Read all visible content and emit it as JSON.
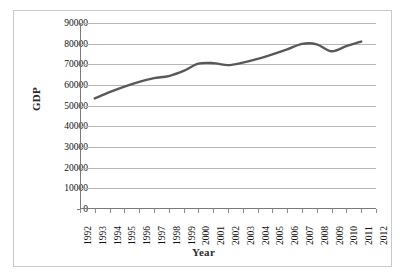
{
  "chart_data": {
    "type": "line",
    "title": "",
    "xlabel": "Year",
    "ylabel": "GDP",
    "x": [
      1993,
      1994,
      1995,
      1996,
      1997,
      1998,
      1999,
      2000,
      2001,
      2002,
      2003,
      2004,
      2005,
      2006,
      2007,
      2008,
      2009,
      2010,
      2011
    ],
    "values": [
      53500,
      56500,
      59200,
      61500,
      63300,
      64300,
      66800,
      70300,
      70600,
      69600,
      70800,
      72600,
      74800,
      77200,
      79900,
      79700,
      76300,
      78800,
      81000
    ],
    "series": [
      {
        "name": "GDP",
        "color": "#595959",
        "values": [
          53500,
          56500,
          59200,
          61500,
          63300,
          64300,
          66800,
          70300,
          70600,
          69600,
          70800,
          72600,
          74800,
          77200,
          79900,
          79700,
          76300,
          78800,
          81000
        ]
      }
    ],
    "xlim": [
      1992,
      2012
    ],
    "ylim": [
      0,
      90000
    ],
    "x_tick_labels": [
      "1992",
      "1993",
      "1994",
      "1995",
      "1996",
      "1997",
      "1998",
      "1999",
      "2000",
      "2001",
      "2002",
      "2003",
      "2004",
      "2005",
      "2006",
      "2007",
      "2008",
      "2009",
      "2010",
      "2011",
      "2012"
    ],
    "y_tick_labels": [
      "90000",
      "80000",
      "70000",
      "60000",
      "50000",
      "40000",
      "30000",
      "20000",
      "10000",
      "0"
    ],
    "y_tick_values": [
      90000,
      80000,
      70000,
      60000,
      50000,
      40000,
      30000,
      20000,
      10000,
      0
    ],
    "grid": true,
    "legend": false,
    "legend_position": "none",
    "line_color": "#595959",
    "grid_color": "#b6b6b6",
    "axis_color": "#7a7a7a",
    "border_color": "#c9c9c9",
    "background": "#ffffff"
  }
}
